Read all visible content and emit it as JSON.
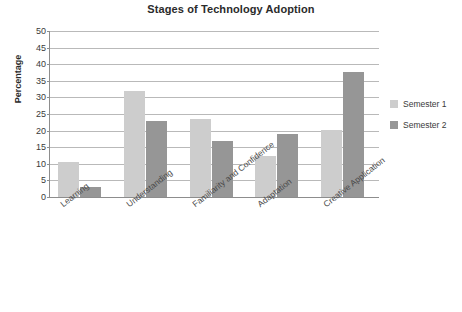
{
  "chart_data": {
    "type": "bar",
    "title": "Stages of Technology Adoption",
    "xlabel": "",
    "ylabel": "Percentage",
    "ylim": [
      0,
      50
    ],
    "ytick_step": 5,
    "yticks": [
      0,
      5,
      10,
      15,
      20,
      25,
      30,
      35,
      40,
      45,
      50
    ],
    "grid": true,
    "legend_position": "right",
    "categories": [
      "Learning",
      "Understanding",
      "Familiarity and Confidence",
      "Adaptation",
      "Creative Application"
    ],
    "series": [
      {
        "name": "Semester 1",
        "color": "#cdcdcd",
        "values": [
          10.5,
          32,
          23.5,
          12.5,
          20.3
        ]
      },
      {
        "name": "Semester 2",
        "color": "#969696",
        "values": [
          3,
          23,
          17,
          19,
          37.8
        ]
      }
    ]
  },
  "legend": {
    "items": [
      {
        "label": "Semester 1",
        "color": "#cdcdcd"
      },
      {
        "label": "Semester 2",
        "color": "#969696"
      }
    ]
  },
  "axes": {
    "y_title": "Percentage"
  }
}
